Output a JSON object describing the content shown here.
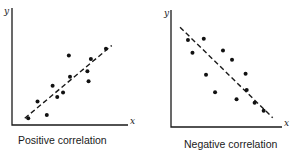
{
  "chart_data": [
    {
      "type": "scatter",
      "title": "Positive correlation",
      "xlabel": "x",
      "ylabel": "y",
      "xlim": [
        0,
        10
      ],
      "ylim": [
        0,
        10
      ],
      "grid": false,
      "ticks": false,
      "trendline": {
        "style": "dashed",
        "from": [
          1.1,
          0.6
        ],
        "to": [
          8.6,
          7.1
        ]
      },
      "points": [
        {
          "x": 1.4,
          "y": 0.6
        },
        {
          "x": 2.2,
          "y": 2.1
        },
        {
          "x": 3.0,
          "y": 0.9
        },
        {
          "x": 3.5,
          "y": 3.5
        },
        {
          "x": 3.9,
          "y": 2.5
        },
        {
          "x": 4.4,
          "y": 2.9
        },
        {
          "x": 4.9,
          "y": 6.2
        },
        {
          "x": 5.0,
          "y": 4.3
        },
        {
          "x": 6.5,
          "y": 4.8
        },
        {
          "x": 6.6,
          "y": 3.9
        },
        {
          "x": 6.8,
          "y": 5.9
        },
        {
          "x": 8.1,
          "y": 6.8
        }
      ]
    },
    {
      "type": "scatter",
      "title": "Negative correlation",
      "xlabel": "x",
      "ylabel": "y",
      "xlim": [
        0,
        10
      ],
      "ylim": [
        0,
        10
      ],
      "grid": false,
      "ticks": false,
      "trendline": {
        "style": "dashed",
        "from": [
          0.8,
          8.6
        ],
        "to": [
          9.0,
          0.8
        ]
      },
      "points": [
        {
          "x": 1.5,
          "y": 7.5
        },
        {
          "x": 1.9,
          "y": 6.4
        },
        {
          "x": 2.9,
          "y": 7.6
        },
        {
          "x": 3.1,
          "y": 4.5
        },
        {
          "x": 3.9,
          "y": 3.0
        },
        {
          "x": 4.6,
          "y": 6.6
        },
        {
          "x": 5.4,
          "y": 5.8
        },
        {
          "x": 5.8,
          "y": 2.4
        },
        {
          "x": 6.6,
          "y": 4.6
        },
        {
          "x": 6.7,
          "y": 3.2
        },
        {
          "x": 7.4,
          "y": 2.1
        },
        {
          "x": 8.2,
          "y": 1.4
        }
      ]
    }
  ],
  "layout": {
    "panels": [
      {
        "origin": [
          12,
          125
        ],
        "width": 116,
        "height": 117,
        "x_label_pos": [
          130,
          124
        ],
        "y_label_pos": [
          4,
          14
        ],
        "caption_pos": [
          18,
          134
        ],
        "scale": [
          11.6,
          11.2
        ]
      },
      {
        "origin": [
          171,
          127
        ],
        "width": 111,
        "height": 117,
        "x_label_pos": [
          284,
          126
        ],
        "y_label_pos": [
          164,
          16
        ],
        "caption_pos": [
          184,
          138
        ],
        "scale": [
          11.3,
          11.6
        ]
      }
    ]
  },
  "colors": {
    "ink": "#1a1a1a",
    "background": "#ffffff"
  }
}
